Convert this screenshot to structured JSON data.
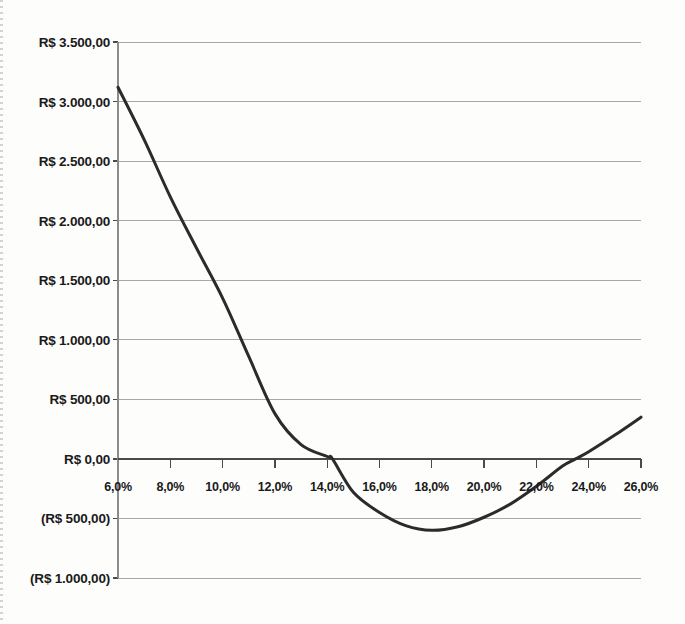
{
  "chart_data": {
    "type": "line",
    "title": "",
    "subtitle": "",
    "xlabel": "",
    "ylabel": "",
    "currency_prefix": "R$",
    "grid": true,
    "legend": false,
    "legend_position": "none",
    "xlim": [
      6.0,
      26.0
    ],
    "ylim": [
      -1000,
      3500
    ],
    "x_tick_step": 2.0,
    "y_tick_step": 500,
    "x_tick_labels": [
      "6,0%",
      "8,0%",
      "10,0%",
      "12,0%",
      "14,0%",
      "16,0%",
      "18,0%",
      "20,0%",
      "22,0%",
      "24,0%",
      "26,0%"
    ],
    "x_tick_values": [
      6.0,
      8.0,
      10.0,
      12.0,
      14.0,
      16.0,
      18.0,
      20.0,
      22.0,
      24.0,
      26.0
    ],
    "y_tick_labels": [
      "R$ 3.500,00",
      "R$ 3.000,00",
      "R$ 2.500,00",
      "R$ 2.000,00",
      "R$ 1.500,00",
      "R$ 1.000,00",
      "R$ 500,00",
      "R$ 0,00",
      "(R$ 500,00)",
      "(R$ 1.000,00)"
    ],
    "y_tick_values": [
      3500,
      3000,
      2500,
      2000,
      1500,
      1000,
      500,
      0,
      -500,
      -1000
    ],
    "series": [
      {
        "name": "VPL",
        "color": "#2b2b2b",
        "line_width": 3,
        "x": [
          6.0,
          7.0,
          8.0,
          9.0,
          10.0,
          11.0,
          12.0,
          13.0,
          14.0,
          14.2,
          15.0,
          16.0,
          17.0,
          18.0,
          19.0,
          20.0,
          21.0,
          22.0,
          23.0,
          23.5,
          24.0,
          25.0,
          26.0
        ],
        "values": [
          3120,
          2680,
          2200,
          1770,
          1350,
          860,
          380,
          120,
          20,
          0,
          -280,
          -450,
          -560,
          -600,
          -570,
          -490,
          -380,
          -230,
          -60,
          0,
          60,
          200,
          350
        ]
      }
    ],
    "zero_crossings": [
      14.2,
      23.5
    ],
    "minimum": {
      "x": 18.0,
      "y": -600
    },
    "start_point": {
      "x": 6.0,
      "y": 3120
    },
    "end_point": {
      "x": 26.0,
      "y": 350
    },
    "axis_color": "#8c8c8c",
    "zero_axis_color": "#4a4a4a",
    "grid_color": "#a8a8a8",
    "text_color": "#1a1a1a",
    "background": "#fdfdfc"
  }
}
